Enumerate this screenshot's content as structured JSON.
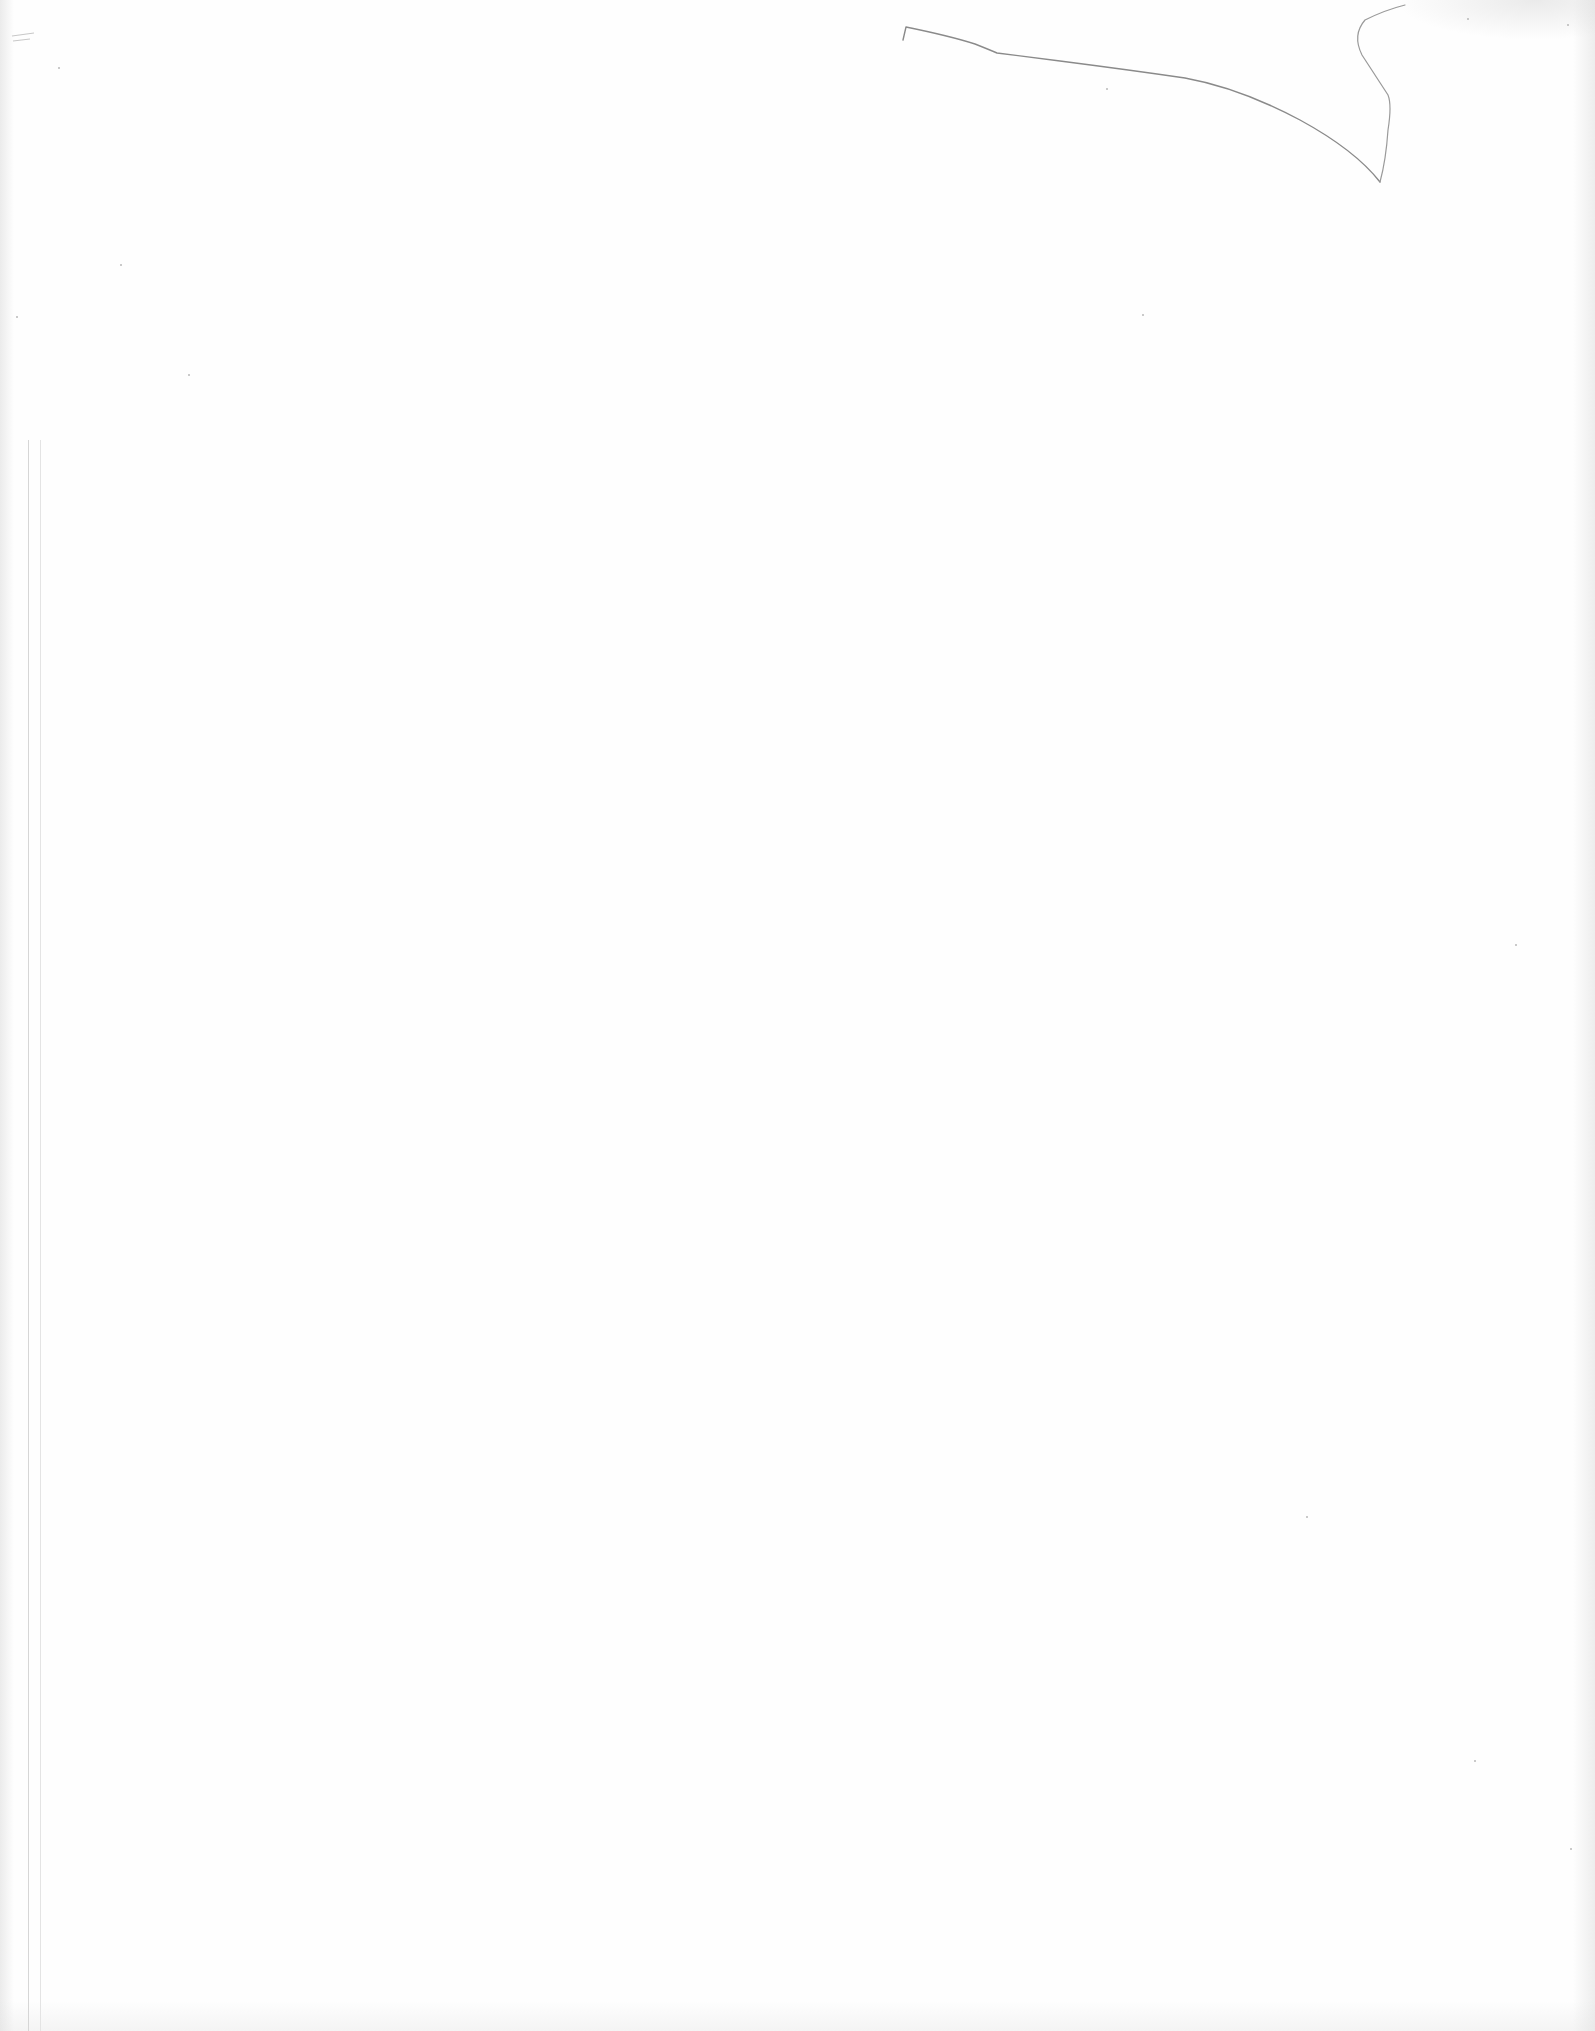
{
  "document": {
    "type": "blank scanned page",
    "text_content": [],
    "marks": [
      {
        "kind": "pencil-stroke",
        "location": "top-right",
        "color": "#8a8a8a"
      },
      {
        "kind": "margin-line",
        "location": "left-edge",
        "color": "#d6d6d6"
      }
    ],
    "background_color": "#fefefe"
  }
}
